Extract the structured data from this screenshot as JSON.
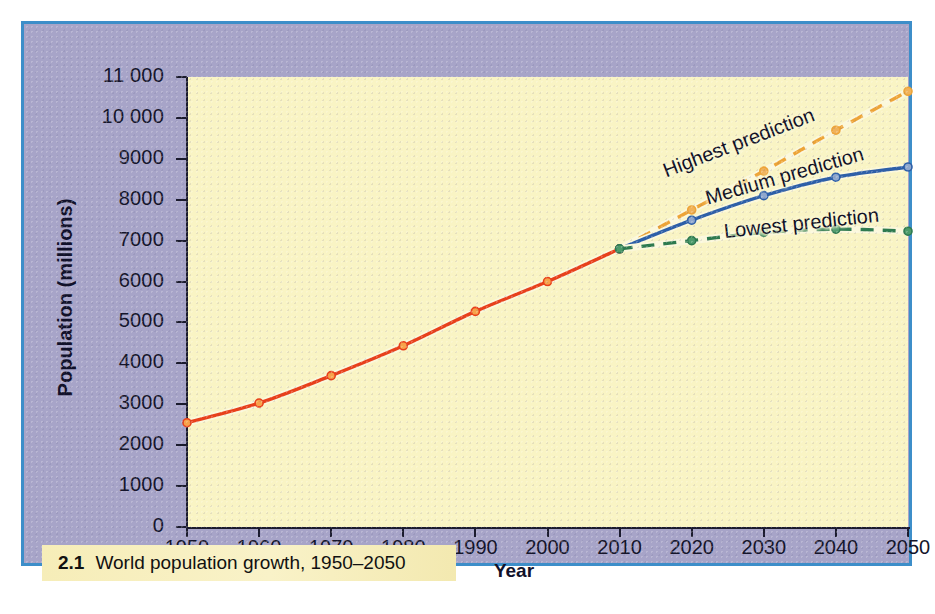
{
  "figure": {
    "caption_number": "2.1",
    "caption_text": "World population growth, 1950–2050"
  },
  "colors": {
    "frame_border": "#3d8ec9",
    "panel_background": "#a7a4c8",
    "plot_background": "#f9f4c4",
    "caption_background": "#f6edb8",
    "historical": "#e8401b",
    "highest": "#eda437",
    "medium": "#2d5fa8",
    "lowest": "#2e7a4f",
    "axis": "#1b1b2e"
  },
  "chart_data": {
    "type": "line",
    "title": "World population growth, 1950–2050",
    "xlabel": "Year",
    "ylabel": "Population (millions)",
    "xlim": [
      1950,
      2050
    ],
    "ylim": [
      0,
      11000
    ],
    "grid": false,
    "legend_position": "inline-labels",
    "xticks": [
      1950,
      1960,
      1970,
      1980,
      1990,
      2000,
      2010,
      2020,
      2030,
      2040,
      2050
    ],
    "xtick_labels": [
      "1950",
      "1960",
      "1970",
      "1980",
      "1990",
      "2000",
      "2010",
      "2020",
      "2030",
      "2040",
      "2050"
    ],
    "yticks": [
      0,
      1000,
      2000,
      3000,
      4000,
      5000,
      6000,
      7000,
      8000,
      9000,
      10000,
      11000
    ],
    "ytick_labels": [
      "0",
      "1000",
      "2000",
      "3000",
      "4000",
      "5000",
      "6000",
      "7000",
      "8000",
      "9000",
      "10 000",
      "11 000"
    ],
    "series": [
      {
        "name": "Historical",
        "style": "solid",
        "color": "#e8401b",
        "x": [
          1950,
          1960,
          1970,
          1980,
          1990,
          2000,
          2010
        ],
        "values": [
          2550,
          3030,
          3700,
          4430,
          5270,
          6000,
          6800
        ]
      },
      {
        "name": "Highest prediction",
        "style": "dashed",
        "color": "#eda437",
        "x": [
          2010,
          2020,
          2030,
          2040,
          2050
        ],
        "values": [
          6800,
          7750,
          8700,
          9700,
          10650
        ]
      },
      {
        "name": "Medium prediction",
        "style": "solid",
        "color": "#2d5fa8",
        "x": [
          2010,
          2020,
          2030,
          2040,
          2050
        ],
        "values": [
          6800,
          7500,
          8100,
          8550,
          8800
        ]
      },
      {
        "name": "Lowest prediction",
        "style": "dashed",
        "color": "#2e7a4f",
        "x": [
          2010,
          2020,
          2030,
          2040,
          2050
        ],
        "values": [
          6800,
          7000,
          7200,
          7280,
          7230
        ]
      }
    ],
    "annotations": [
      {
        "text": "Highest prediction",
        "series": "Highest prediction"
      },
      {
        "text": "Medium prediction",
        "series": "Medium prediction"
      },
      {
        "text": "Lowest prediction",
        "series": "Lowest prediction"
      }
    ]
  }
}
